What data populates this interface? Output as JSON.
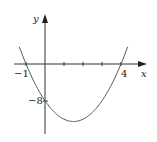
{
  "chart_data": {
    "type": "line",
    "title": "",
    "xlabel": "x",
    "ylabel": "y",
    "function": "y = 2x^2 - 6x - 8",
    "x": [
      -1.3,
      -1,
      0,
      0.5,
      1,
      1.5,
      2,
      2.5,
      3,
      3.5,
      4,
      4.3
    ],
    "y": [
      2.18,
      0,
      -8,
      -10.5,
      -12,
      -12.5,
      -12,
      -10.5,
      -8,
      -4.5,
      0,
      3.18
    ],
    "annotations": {
      "x_intercepts": [
        -1,
        4
      ],
      "y_intercept": -8
    },
    "tick_labels": {
      "x": [
        "-1",
        "4"
      ],
      "y": [
        "-8"
      ]
    },
    "grid": false,
    "legend": null
  },
  "labels": {
    "y_axis": "y",
    "x_axis": "x",
    "x_neg1": "−1",
    "x_4": "4",
    "y_neg8": "−8"
  },
  "colors": {
    "axis": "#333333",
    "curve": "#555555"
  }
}
